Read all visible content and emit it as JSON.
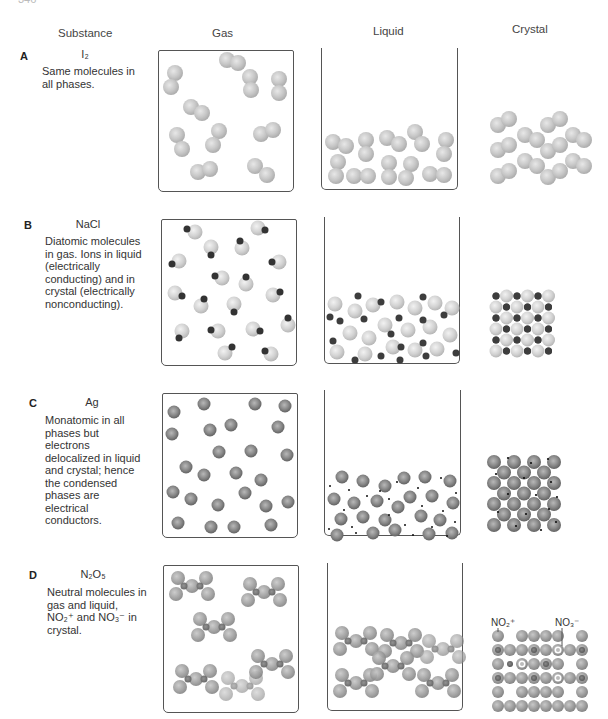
{
  "page": {
    "number_partial": "346"
  },
  "headers": {
    "substance": "Substance",
    "gas": "Gas",
    "liquid": "Liquid",
    "crystal": "Crystal"
  },
  "rows": [
    {
      "letter": "A",
      "formula": "I₂",
      "description": "Same molecules in all phases."
    },
    {
      "letter": "B",
      "formula": "NaCl",
      "description": "Diatomic molecules in gas. Ions in liquid (electrically conducting) and in crystal (electrically nonconducting)."
    },
    {
      "letter": "C",
      "formula": "Ag",
      "description": "Monatomic in all phases but electrons delocalized in liquid and crystal; hence the condensed phases are electrical conductors."
    },
    {
      "letter": "D",
      "formula": "N₂O₅",
      "description": "Neutral molecules in gas and liquid, NO₂⁺ and NO₃⁻ in crystal."
    }
  ],
  "crystal_labels": {
    "cation": "NO₂⁺",
    "anion": "NO₃⁻"
  },
  "colors": {
    "sphere_light": "#d8d8d8",
    "sphere_mid": "#a8a8a8",
    "sphere_dark": "#7a7a7a",
    "ion_dark": "#3a3a3a",
    "box_border": "#555555"
  }
}
